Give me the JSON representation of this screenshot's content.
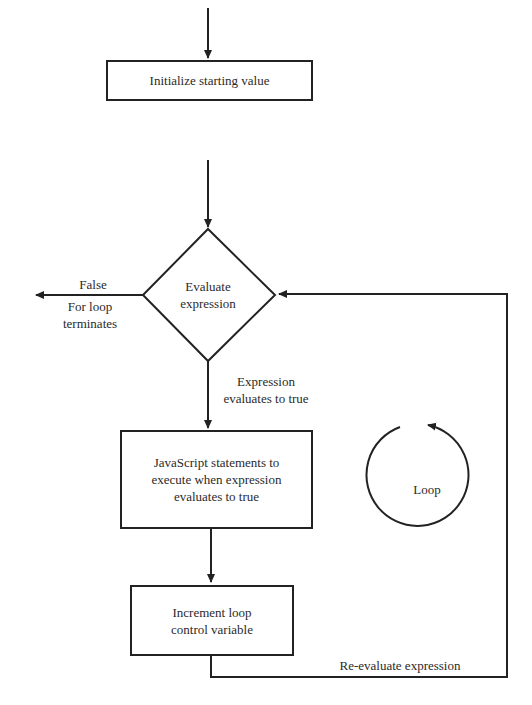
{
  "diagram": {
    "type": "flowchart",
    "nodes": {
      "init": {
        "label": "Initialize starting value"
      },
      "evaluate": {
        "line1": "Evaluate",
        "line2": "expression"
      },
      "statements": {
        "line1": "JavaScript statements to",
        "line2": "execute when expression",
        "line3": "evaluates to true"
      },
      "increment": {
        "line1": "Increment loop",
        "line2": "control variable"
      }
    },
    "edges": {
      "false_label": "False",
      "terminate_line1": "For loop",
      "terminate_line2": "terminates",
      "true_line1": "Expression",
      "true_line2": "evaluates to true",
      "reevaluate": "Re-evaluate expression"
    },
    "loop_indicator": {
      "label": "Loop"
    },
    "colors": {
      "stroke": "#222222",
      "text": "#2a2a2a",
      "background": "#ffffff"
    }
  }
}
